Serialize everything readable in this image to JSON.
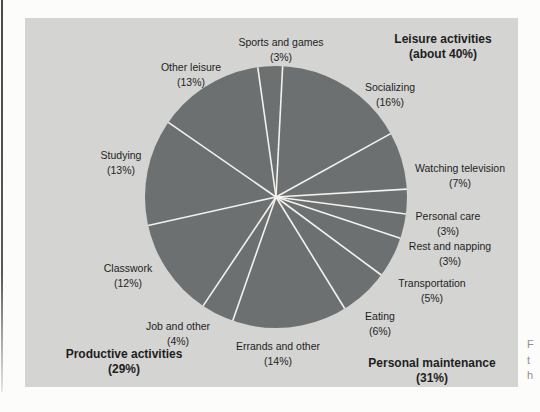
{
  "page": {
    "caption_fragments": [
      {
        "text": "F",
        "top": 338
      },
      {
        "text": "t",
        "top": 354
      },
      {
        "text": "h",
        "top": 369
      }
    ]
  },
  "chart_data": {
    "type": "pie",
    "title": "",
    "total": 99,
    "start_angle_deg": -8,
    "direction": "clockwise",
    "legend_position": "none",
    "colors": {
      "pie_fill": "#6d7071",
      "divider": "#f3f2ef",
      "panel_bg": "#d4d4d2",
      "page_bg": "#fcfcfa",
      "text": "#1e1e1e"
    },
    "geometry": {
      "cx": 251,
      "cy": 179,
      "r": 131,
      "panel_w": 493,
      "panel_h": 369,
      "divider_width": 1.6
    },
    "slices": [
      {
        "id": "sports-and-games",
        "label": "Sports and games",
        "value": 3,
        "pct_label": "(3%)",
        "label_x": 256,
        "label_y": 17
      },
      {
        "id": "socializing",
        "label": "Socializing",
        "value": 16,
        "pct_label": "(16%)",
        "label_x": 365,
        "label_y": 62
      },
      {
        "id": "watching-television",
        "label": "Watching television",
        "value": 7,
        "pct_label": "(7%)",
        "label_x": 435,
        "label_y": 143
      },
      {
        "id": "personal-care",
        "label": "Personal care",
        "value": 3,
        "pct_label": "(3%)",
        "label_x": 423,
        "label_y": 191
      },
      {
        "id": "rest-and-napping",
        "label": "Rest and napping",
        "value": 3,
        "pct_label": "(3%)",
        "label_x": 425,
        "label_y": 221
      },
      {
        "id": "transportation",
        "label": "Transportation",
        "value": 5,
        "pct_label": "(5%)",
        "label_x": 407,
        "label_y": 258
      },
      {
        "id": "eating",
        "label": "Eating",
        "value": 6,
        "pct_label": "(6%)",
        "label_x": 355,
        "label_y": 291
      },
      {
        "id": "errands-and-other",
        "label": "Errands and other",
        "value": 14,
        "pct_label": "(14%)",
        "label_x": 253,
        "label_y": 321
      },
      {
        "id": "job-and-other",
        "label": "Job and other",
        "value": 4,
        "pct_label": "(4%)",
        "label_x": 153,
        "label_y": 301
      },
      {
        "id": "classwork",
        "label": "Classwork",
        "value": 12,
        "pct_label": "(12%)",
        "label_x": 103,
        "label_y": 243
      },
      {
        "id": "studying",
        "label": "Studying",
        "value": 13,
        "pct_label": "(13%)",
        "label_x": 96,
        "label_y": 130
      },
      {
        "id": "other-leisure",
        "label": "Other leisure",
        "value": 13,
        "pct_label": "(13%)",
        "label_x": 166,
        "label_y": 42
      }
    ],
    "groups": [
      {
        "id": "leisure-activities",
        "label": "Leisure activities",
        "pct_label": "(about 40%)",
        "label_x": 418,
        "label_y": 14
      },
      {
        "id": "productive-activities",
        "label": "Productive activities",
        "pct_label": "(29%)",
        "label_x": 99,
        "label_y": 329
      },
      {
        "id": "personal-maintenance",
        "label": "Personal maintenance",
        "pct_label": "(31%)",
        "label_x": 407,
        "label_y": 338
      }
    ]
  }
}
